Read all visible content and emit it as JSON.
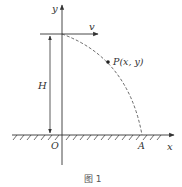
{
  "figure": {
    "caption": "图 1",
    "labels": {
      "y_axis": "y",
      "x_axis": "x",
      "origin": "O",
      "landing_point": "A",
      "velocity": "v",
      "height": "H",
      "point": "P(x, y)"
    },
    "colors": {
      "line": "#333333",
      "text": "#333333",
      "caption": "#555555"
    }
  }
}
